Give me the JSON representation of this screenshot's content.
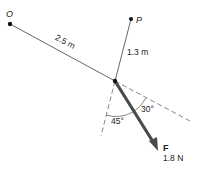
{
  "diagram": {
    "points": {
      "O": {
        "label": "O",
        "x": 10,
        "y": 24
      },
      "P": {
        "label": "P",
        "x": 131,
        "y": 19
      },
      "A": {
        "x": 115,
        "y": 81
      }
    },
    "segments": {
      "OA": {
        "label": "2.5 m"
      },
      "PA": {
        "label": "1.3 m"
      }
    },
    "force": {
      "name": "F",
      "magnitude": "1.8 N",
      "color": "#4a4a4a"
    },
    "angles": {
      "vertical_to_force": "45°",
      "line_to_force": "30°"
    }
  }
}
